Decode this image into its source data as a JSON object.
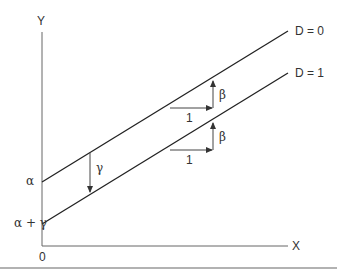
{
  "diagram": {
    "type": "regression-dummy-variable-intercept-shift",
    "axes": {
      "y_label": "Y",
      "x_label": "X",
      "origin_label": "0"
    },
    "lines": [
      {
        "label": "D = 0",
        "intercept_label": "α"
      },
      {
        "label": "D = 1",
        "intercept_label": "α + γ"
      }
    ],
    "annotations": {
      "shift_label": "γ",
      "slope_run_label_upper": "1",
      "slope_rise_label_upper": "β",
      "slope_run_label_lower": "1",
      "slope_rise_label_lower": "β"
    },
    "colors": {
      "line": "#222222",
      "axis": "#555555",
      "text": "#333333",
      "border": "#666666"
    }
  }
}
